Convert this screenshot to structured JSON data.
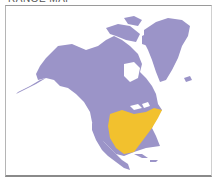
{
  "caption": {
    "text": "RANGE MAP"
  },
  "map": {
    "region": "North America",
    "range_color": "#9b94c8",
    "highlight_color": "#f2c12e",
    "background_color": "#ffffff",
    "legend_visible": false,
    "highlighted_area": "Central and eastern United States"
  }
}
